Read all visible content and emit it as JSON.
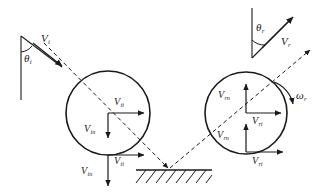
{
  "diagram": {
    "stroke_color": "#1a1a1a",
    "background_color": "#ffffff",
    "incident": {
      "angle_label": {
        "symbol": "θ",
        "subscript": "i"
      },
      "velocity_label": {
        "symbol": "V",
        "subscript": "i"
      },
      "tangential_label": {
        "symbol": "V",
        "subscript": "it"
      },
      "normal_label": {
        "symbol": "V",
        "subscript": "in"
      },
      "tangential_label_contact": {
        "symbol": "V",
        "subscript": "it"
      },
      "normal_label_contact": {
        "symbol": "V",
        "subscript": "in"
      }
    },
    "rebound": {
      "angle_label": {
        "symbol": "θ",
        "subscript": "r"
      },
      "velocity_label": {
        "symbol": "V",
        "subscript": "r"
      },
      "tangential_label": {
        "symbol": "V",
        "subscript": "rt"
      },
      "normal_label": {
        "symbol": "V",
        "subscript": "rn"
      },
      "tangential_label_contact": {
        "symbol": "V",
        "subscript": "rt"
      },
      "normal_label_contact": {
        "symbol": "V",
        "subscript": "rn"
      },
      "angular_velocity_label": {
        "symbol": "ω",
        "subscript": "r"
      }
    },
    "ground": {
      "name": "hatched-ground-surface"
    }
  }
}
